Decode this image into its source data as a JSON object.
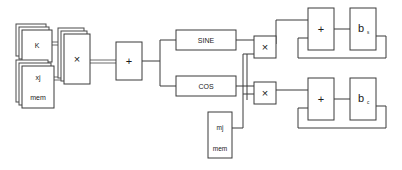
{
  "diagram": {
    "canvas": {
      "width": 402,
      "height": 170,
      "background": "#ffffff"
    },
    "stroke_color": "#3a3a3a",
    "text_color": "#1a1a1a",
    "blocks": {
      "k_mem": {
        "label": "K",
        "x": 22,
        "y": 30,
        "w": 30,
        "h": 32,
        "stack": 3
      },
      "xj_mem": {
        "label_top": "xj",
        "label_bottom": "mem",
        "x": 22,
        "y": 66,
        "w": 32,
        "h": 42,
        "stack": 3
      },
      "mult_input": {
        "label": "×",
        "x": 64,
        "y": 34,
        "w": 26,
        "h": 50,
        "stack": 3
      },
      "adder_input": {
        "label": "+",
        "x": 116,
        "y": 42,
        "w": 26,
        "h": 38
      },
      "sine": {
        "label": "SINE",
        "x": 176,
        "y": 30,
        "w": 60,
        "h": 20
      },
      "cos": {
        "label": "COS",
        "x": 176,
        "y": 76,
        "w": 60,
        "h": 20
      },
      "mj_mem": {
        "label_top": "mj",
        "label_bottom": "mem",
        "x": 208,
        "y": 112,
        "w": 24,
        "h": 46
      },
      "mult_sine": {
        "label": "×",
        "x": 254,
        "y": 36,
        "w": 22,
        "h": 22
      },
      "mult_cos": {
        "label": "×",
        "x": 254,
        "y": 82,
        "w": 22,
        "h": 22
      },
      "acc_adder_s": {
        "label": "+",
        "x": 308,
        "y": 8,
        "w": 26,
        "h": 42
      },
      "acc_reg_s": {
        "label_base": "b",
        "label_sub": "s",
        "x": 350,
        "y": 8,
        "w": 26,
        "h": 42
      },
      "acc_adder_c": {
        "label": "+",
        "x": 308,
        "y": 78,
        "w": 26,
        "h": 42
      },
      "acc_reg_c": {
        "label_base": "b",
        "label_sub": "c",
        "x": 350,
        "y": 78,
        "w": 26,
        "h": 42
      }
    },
    "connections": [
      {
        "name": "k-to-mult",
        "type": "bus"
      },
      {
        "name": "xj-to-mult",
        "type": "bus"
      },
      {
        "name": "mult-to-adder",
        "type": "bus"
      },
      {
        "name": "adder-fanout-to-sine-cos",
        "type": "wire"
      },
      {
        "name": "sine-to-mult-sine",
        "type": "wire"
      },
      {
        "name": "cos-to-mult-cos",
        "type": "wire"
      },
      {
        "name": "mj-to-multipliers",
        "type": "wire"
      },
      {
        "name": "mult-sine-to-acc-adder-s",
        "type": "wire"
      },
      {
        "name": "mult-cos-to-acc-adder-c",
        "type": "wire"
      },
      {
        "name": "acc-adder-s-to-reg-s",
        "type": "wire"
      },
      {
        "name": "acc-adder-c-to-reg-c",
        "type": "wire"
      },
      {
        "name": "reg-s-feedback",
        "type": "wire"
      },
      {
        "name": "reg-c-feedback",
        "type": "wire"
      }
    ]
  }
}
